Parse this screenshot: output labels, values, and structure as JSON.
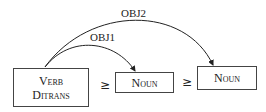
{
  "diagram": {
    "nodes": [
      {
        "id": "verb",
        "lines": [
          "Verb",
          "Ditrans"
        ]
      },
      {
        "id": "noun1",
        "label": "Noun"
      },
      {
        "id": "noun2",
        "label": "Noun"
      }
    ],
    "relations": [
      "≥",
      "≥"
    ],
    "edges": [
      {
        "from": "verb",
        "to": "noun1",
        "label": "OBJ1"
      },
      {
        "from": "verb",
        "to": "noun2",
        "label": "OBJ2"
      }
    ]
  }
}
